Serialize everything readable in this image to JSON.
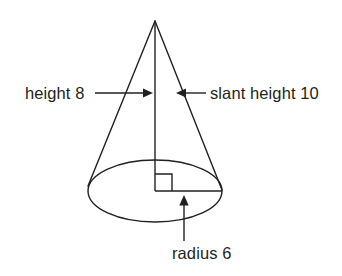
{
  "figure": {
    "name": "cone-with-dimension-labels",
    "background_color": "#ffffff",
    "stroke_color": "#231f20",
    "text_color": "#231f20",
    "labels": {
      "height": "height 8",
      "slant_height": "slant height 10",
      "radius": "radius 6"
    },
    "geometry": {
      "apex": {
        "x": 155,
        "y": 21
      },
      "base_center": {
        "x": 155,
        "y": 191
      },
      "base_rx": 67,
      "base_ry": 31,
      "left_base_point": {
        "x": 88,
        "y": 188
      },
      "right_base_point": {
        "x": 222,
        "y": 188
      },
      "right_angle_marker": {
        "x": 155,
        "y": 174,
        "size": 17
      }
    },
    "annotations": [
      {
        "id": "height-annotation",
        "text": "height 8",
        "text_x": 25,
        "text_y": 99,
        "leader_from": {
          "x": 95,
          "y": 93
        },
        "leader_to": {
          "x": 152,
          "y": 93
        },
        "arrow_direction": "right",
        "points_to": "height-line"
      },
      {
        "id": "slant-height-annotation",
        "text": "slant height 10",
        "text_x": 210,
        "text_y": 99,
        "leader_from": {
          "x": 206,
          "y": 93
        },
        "leader_to": {
          "x": 176,
          "y": 93
        },
        "arrow_direction": "left",
        "points_to": "right-slant-edge"
      },
      {
        "id": "radius-annotation",
        "text": "radius 6",
        "text_x": 172,
        "text_y": 259,
        "leader_from": {
          "x": 184,
          "y": 241
        },
        "leader_to": {
          "x": 184,
          "y": 196
        },
        "arrow_direction": "up",
        "points_to": "radius-line"
      }
    ]
  }
}
